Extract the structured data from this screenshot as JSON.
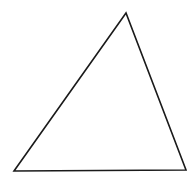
{
  "diagram": {
    "type": "triangle",
    "stroke_color": "#1a1a1a",
    "fill_color": "#ffffff",
    "stroke_width": 1.6,
    "vertices": [
      {
        "name": "apex",
        "x": 126,
        "y": 13
      },
      {
        "name": "bottom-left",
        "x": 14,
        "y": 171
      },
      {
        "name": "bottom-right",
        "x": 186,
        "y": 170
      }
    ]
  }
}
